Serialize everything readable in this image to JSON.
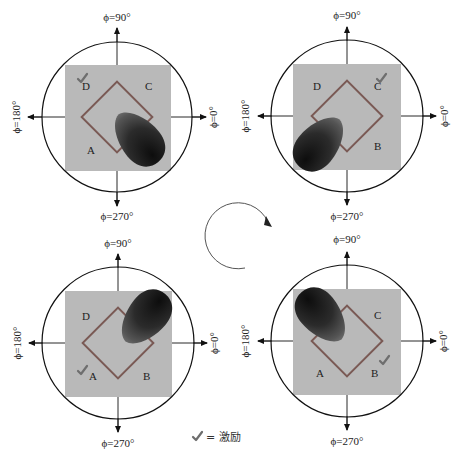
{
  "colors": {
    "square_fill": "#b9b9b9",
    "diamond_stroke": "#7a5a55",
    "circle_stroke": "#111111",
    "check_color": "#6e6e6e",
    "beam_dark": "#1a1a1a",
    "beam_mid": "#555555"
  },
  "axis_labels": {
    "top": "ϕ=90°",
    "bottom": "ϕ=270°",
    "left": "ϕ=180°",
    "right": "ϕ=0°"
  },
  "corner_labels": {
    "A": "A",
    "B": "B",
    "C": "C",
    "D": "D"
  },
  "panels": [
    {
      "position": "top-left",
      "excited_port": "D",
      "beam_direction": "lower-right",
      "visible_labels": [
        "D",
        "C",
        "A"
      ]
    },
    {
      "position": "top-right",
      "excited_port": "C",
      "beam_direction": "lower-left",
      "visible_labels": [
        "D",
        "C",
        "B"
      ]
    },
    {
      "position": "bottom-left",
      "excited_port": "A",
      "beam_direction": "upper-right",
      "visible_labels": [
        "D",
        "A",
        "B"
      ]
    },
    {
      "position": "bottom-right",
      "excited_port": "B",
      "beam_direction": "upper-left",
      "visible_labels": [
        "C",
        "A",
        "B"
      ]
    }
  ],
  "rotation_arrow": {
    "direction": "clockwise"
  },
  "legend": {
    "symbol": "check-mark",
    "text": "= 激励"
  }
}
